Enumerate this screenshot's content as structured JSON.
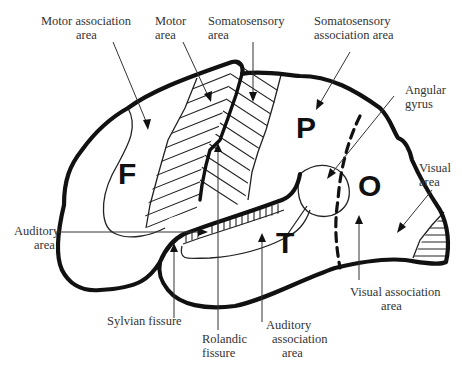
{
  "figure": {
    "type": "lateral-brain-diagram",
    "lobes": [
      {
        "id": "frontal",
        "letter": "F"
      },
      {
        "id": "parietal",
        "letter": "P"
      },
      {
        "id": "occipital",
        "letter": "O"
      },
      {
        "id": "temporal",
        "letter": "T"
      }
    ],
    "labels": {
      "motor_association": [
        "Motor association",
        "area"
      ],
      "motor": [
        "Motor",
        "area"
      ],
      "somatosensory": [
        "Somatosensory",
        "area"
      ],
      "somatosensory_association": [
        "Somatosensory",
        "association area"
      ],
      "angular_gyrus": [
        "Angular",
        "gyrus"
      ],
      "visual": [
        "Visual",
        "area"
      ],
      "auditory": [
        "Auditory",
        "area"
      ],
      "visual_association": [
        "Visual association",
        "area"
      ],
      "sylvian_fissure": [
        "Sylvian fissure"
      ],
      "rolandic_fissure": [
        "Rolandic",
        "fissure"
      ],
      "auditory_association": [
        "Auditory",
        "association",
        "area"
      ]
    },
    "colors": {
      "ink": "#111111",
      "label_text": "#333333",
      "background": "#ffffff"
    }
  }
}
